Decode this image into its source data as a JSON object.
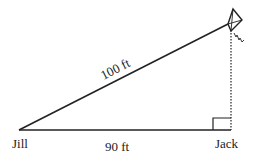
{
  "diagram": {
    "hypotenuse_label": "100 ft",
    "base_label": "90 ft",
    "left_vertex_label": "Jill",
    "right_vertex_label": "Jack",
    "colors": {
      "line": "#222222",
      "background": "#ffffff"
    },
    "elements": [
      "kite-icon",
      "kite-string",
      "ground-line",
      "vertical-height-dotted",
      "right-angle-marker"
    ]
  }
}
